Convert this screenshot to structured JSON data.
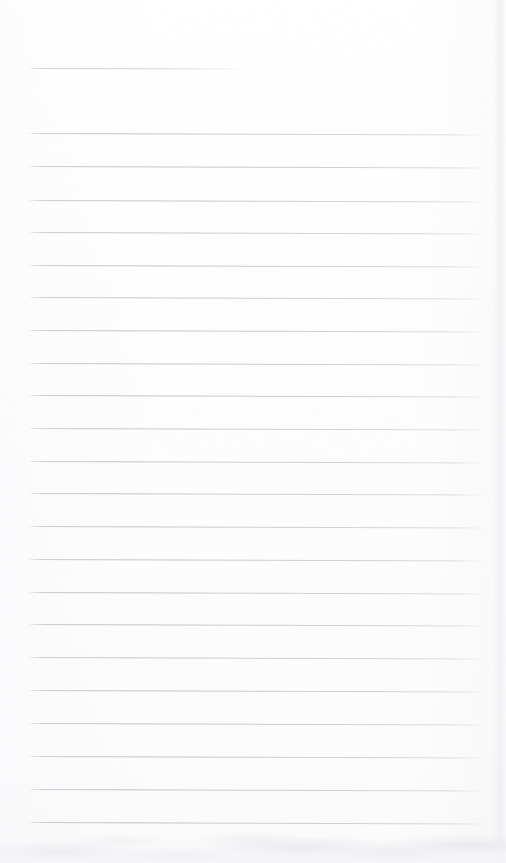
{
  "document": {
    "kind": "scanned-lined-paper",
    "page_width": 506,
    "page_height": 863,
    "background_color": "#fdfdfe",
    "rule_color": "#c9caCE",
    "edge_shadow_color": "#ebebef",
    "visible_text": "",
    "notes": "Blank ruled writing sheet. No printed or handwritten text is visible anywhere on the page."
  },
  "ruling": {
    "left_margin_x": 28,
    "right_end_x": 486,
    "line_thickness_px": 1,
    "line_spacing_px": 32.5,
    "first_rule_is_short": true,
    "short_rule_right_end_x": 243,
    "total_rules": 22,
    "rules": [
      {
        "index": 1,
        "y": 68,
        "x1": 28,
        "x2": 243,
        "slope_px": 0.6,
        "weight": 0.8,
        "short": true
      },
      {
        "index": 2,
        "y": 132.5,
        "x1": 28,
        "x2": 487,
        "slope_px": 1.6,
        "weight": 0.95,
        "short": false
      },
      {
        "index": 3,
        "y": 166.0,
        "x1": 28,
        "x2": 487,
        "slope_px": 1.4,
        "weight": 0.98,
        "short": false
      },
      {
        "index": 4,
        "y": 199.5,
        "x1": 28,
        "x2": 487,
        "slope_px": 1.5,
        "weight": 0.96,
        "short": false
      },
      {
        "index": 5,
        "y": 232.0,
        "x1": 28,
        "x2": 487,
        "slope_px": 1.4,
        "weight": 0.94,
        "short": false
      },
      {
        "index": 6,
        "y": 264.5,
        "x1": 28,
        "x2": 487,
        "slope_px": 1.6,
        "weight": 0.97,
        "short": false
      },
      {
        "index": 7,
        "y": 297.0,
        "x1": 28,
        "x2": 487,
        "slope_px": 1.5,
        "weight": 0.93,
        "short": false
      },
      {
        "index": 8,
        "y": 329.5,
        "x1": 28,
        "x2": 487,
        "slope_px": 1.4,
        "weight": 0.96,
        "short": false
      },
      {
        "index": 9,
        "y": 362.5,
        "x1": 28,
        "x2": 487,
        "slope_px": 1.5,
        "weight": 0.95,
        "short": false
      },
      {
        "index": 10,
        "y": 395.0,
        "x1": 28,
        "x2": 487,
        "slope_px": 1.6,
        "weight": 0.97,
        "short": false
      },
      {
        "index": 11,
        "y": 427.5,
        "x1": 28,
        "x2": 487,
        "slope_px": 1.4,
        "weight": 0.92,
        "short": false
      },
      {
        "index": 12,
        "y": 460.5,
        "x1": 28,
        "x2": 487,
        "slope_px": 1.5,
        "weight": 0.95,
        "short": false
      },
      {
        "index": 13,
        "y": 493.0,
        "x1": 28,
        "x2": 487,
        "slope_px": 1.6,
        "weight": 0.96,
        "short": false
      },
      {
        "index": 14,
        "y": 526.0,
        "x1": 28,
        "x2": 487,
        "slope_px": 1.5,
        "weight": 0.94,
        "short": false
      },
      {
        "index": 15,
        "y": 559.0,
        "x1": 28,
        "x2": 487,
        "slope_px": 1.4,
        "weight": 0.97,
        "short": false
      },
      {
        "index": 16,
        "y": 591.5,
        "x1": 28,
        "x2": 487,
        "slope_px": 1.6,
        "weight": 0.95,
        "short": false
      },
      {
        "index": 17,
        "y": 624.0,
        "x1": 28,
        "x2": 487,
        "slope_px": 1.5,
        "weight": 0.96,
        "short": false
      },
      {
        "index": 18,
        "y": 656.5,
        "x1": 28,
        "x2": 487,
        "slope_px": 1.4,
        "weight": 0.93,
        "short": false
      },
      {
        "index": 19,
        "y": 689.5,
        "x1": 28,
        "x2": 487,
        "slope_px": 1.6,
        "weight": 0.97,
        "short": false
      },
      {
        "index": 20,
        "y": 722.5,
        "x1": 28,
        "x2": 487,
        "slope_px": 1.5,
        "weight": 0.95,
        "short": false
      },
      {
        "index": 21,
        "y": 755.5,
        "x1": 28,
        "x2": 487,
        "slope_px": 1.4,
        "weight": 0.96,
        "short": false
      },
      {
        "index": 22,
        "y": 788.5,
        "x1": 28,
        "x2": 487,
        "slope_px": 1.6,
        "weight": 0.98,
        "short": false
      },
      {
        "index": 23,
        "y": 821.5,
        "x1": 28,
        "x2": 487,
        "slope_px": 1.5,
        "weight": 0.97,
        "short": false
      }
    ]
  },
  "edges": {
    "right_edge_start_x": 492,
    "bottom_band_start_y": 833
  }
}
